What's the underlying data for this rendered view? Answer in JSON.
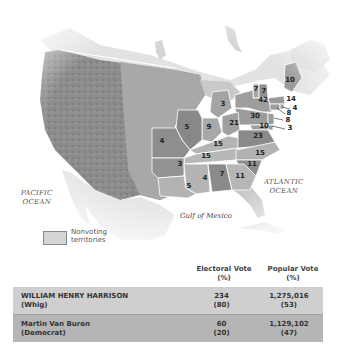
{
  "map": {
    "title": "Election of 1840",
    "ocean_labels": {
      "pacific": [
        "PACIFIC",
        "OCEAN"
      ],
      "atlantic": [
        "ATLANTIC",
        "OCEAN"
      ],
      "gulf": "Gulf of Mexico"
    },
    "legend": {
      "swatch_color": "#d4d4d4",
      "label_line1": "Nonvoting",
      "label_line2": "territories"
    },
    "state_electoral_votes": [
      {
        "state": "Maine",
        "votes": "10",
        "x": 290,
        "y": 82
      },
      {
        "state": "Vermont",
        "votes": "7",
        "x": 256,
        "y": 91
      },
      {
        "state": "New Hampshire",
        "votes": "7",
        "x": 264,
        "y": 93
      },
      {
        "state": "New York",
        "votes": "42",
        "x": 263,
        "y": 102
      },
      {
        "state": "Massachusetts",
        "votes": "14",
        "x": 291,
        "y": 101
      },
      {
        "state": "Rhode Island",
        "votes": "4",
        "x": 295,
        "y": 110
      },
      {
        "state": "Connecticut",
        "votes": "8",
        "x": 289,
        "y": 115
      },
      {
        "state": "New Jersey",
        "votes": "8",
        "x": 288,
        "y": 122
      },
      {
        "state": "Delaware",
        "votes": "3",
        "x": 290,
        "y": 130
      },
      {
        "state": "Maryland",
        "votes": "10",
        "x": 264,
        "y": 128
      },
      {
        "state": "Pennsylvania",
        "votes": "30",
        "x": 255,
        "y": 118
      },
      {
        "state": "Michigan",
        "votes": "3",
        "x": 223,
        "y": 106
      },
      {
        "state": "Ohio",
        "votes": "21",
        "x": 234,
        "y": 125
      },
      {
        "state": "Indiana",
        "votes": "9",
        "x": 209,
        "y": 129
      },
      {
        "state": "Illinois",
        "votes": "5",
        "x": 187,
        "y": 129
      },
      {
        "state": "Missouri",
        "votes": "4",
        "x": 162,
        "y": 143
      },
      {
        "state": "Kentucky",
        "votes": "15",
        "x": 218,
        "y": 146
      },
      {
        "state": "Virginia",
        "votes": "23",
        "x": 258,
        "y": 138
      },
      {
        "state": "Tennessee",
        "votes": "15",
        "x": 206,
        "y": 158
      },
      {
        "state": "North Carolina",
        "votes": "15",
        "x": 260,
        "y": 155
      },
      {
        "state": "Arkansas",
        "votes": "3",
        "x": 180,
        "y": 166
      },
      {
        "state": "South Carolina",
        "votes": "11",
        "x": 252,
        "y": 166
      },
      {
        "state": "Mississippi",
        "votes": "4",
        "x": 205,
        "y": 180
      },
      {
        "state": "Alabama",
        "votes": "7",
        "x": 222,
        "y": 176
      },
      {
        "state": "Georgia",
        "votes": "11",
        "x": 240,
        "y": 178
      },
      {
        "state": "Louisiana",
        "votes": "5",
        "x": 189,
        "y": 188
      }
    ]
  },
  "results": {
    "columns": {
      "electoral_line1": "Electoral Vote",
      "electoral_line2": "(%)",
      "popular_line1": "Popular Vote",
      "popular_line2": "(%)"
    },
    "rows": [
      {
        "candidate": "WILLIAM HENRY HARRISON",
        "party": "(Whig)",
        "electoral_vote": "234",
        "electoral_pct": "(80)",
        "popular_vote": "1,275,016",
        "popular_pct": "(53)",
        "row_color": "#cfcfcf"
      },
      {
        "candidate": "Martin Van Buren",
        "party": "(Democrat)",
        "electoral_vote": "60",
        "electoral_pct": "(20)",
        "popular_vote": "1,129,102",
        "popular_pct": "(47)",
        "row_color": "#b5b5b5"
      }
    ]
  }
}
